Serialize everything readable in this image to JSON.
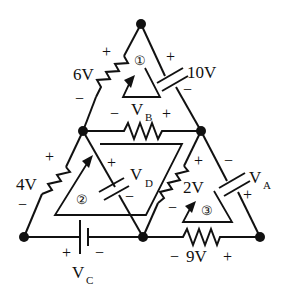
{
  "diagram": {
    "type": "circuit",
    "nodes": [
      {
        "id": "top",
        "x": 141,
        "y": 24
      },
      {
        "id": "mid_left",
        "x": 83,
        "y": 131
      },
      {
        "id": "mid_right",
        "x": 201,
        "y": 131
      },
      {
        "id": "bot_left",
        "x": 24,
        "y": 237
      },
      {
        "id": "bot_mid",
        "x": 143,
        "y": 237
      },
      {
        "id": "bot_right",
        "x": 260,
        "y": 237
      }
    ],
    "elements": {
      "r6": {
        "label": "6V",
        "plus": "+",
        "minus": "−",
        "kind": "resistor"
      },
      "c10": {
        "label": "10V",
        "plus": "+",
        "minus": "−",
        "kind": "capacitor"
      },
      "rB": {
        "label": "V",
        "sub": "B",
        "plus": "+",
        "minus": "−",
        "kind": "resistor"
      },
      "r4": {
        "label": "4V",
        "plus": "+",
        "minus": "−",
        "kind": "resistor"
      },
      "cD": {
        "label": "V",
        "sub": "D",
        "plus": "+",
        "minus": "−",
        "kind": "capacitor"
      },
      "r2": {
        "label": "2V",
        "plus": "+",
        "minus": "−",
        "kind": "resistor"
      },
      "cA": {
        "label": "V",
        "sub": "A",
        "plus": "+",
        "minus": "−",
        "kind": "capacitor"
      },
      "bC": {
        "label": "V",
        "sub": "C",
        "plus": "+",
        "minus": "−",
        "kind": "battery"
      },
      "r9": {
        "label": "9V",
        "plus": "+",
        "minus": "−",
        "kind": "resistor"
      }
    },
    "loops": [
      {
        "id": "1",
        "label": "①"
      },
      {
        "id": "2",
        "label": "②"
      },
      {
        "id": "3",
        "label": "③"
      }
    ]
  }
}
